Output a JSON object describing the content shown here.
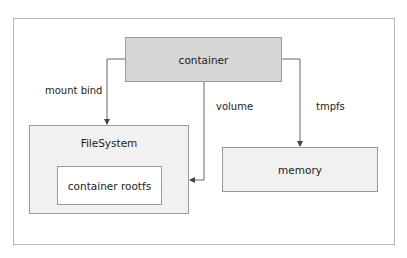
{
  "diagram": {
    "nodes": {
      "container": "container",
      "filesystem": "FileSystem",
      "rootfs": "container rootfs",
      "memory": "memory"
    },
    "edges": {
      "mount_bind": "mount bind",
      "volume": "volume",
      "tmpfs": "tmpfs"
    },
    "colors": {
      "container_fill": "#d6d6d6",
      "box_fill": "#f1f1f1",
      "line": "#555555"
    }
  }
}
